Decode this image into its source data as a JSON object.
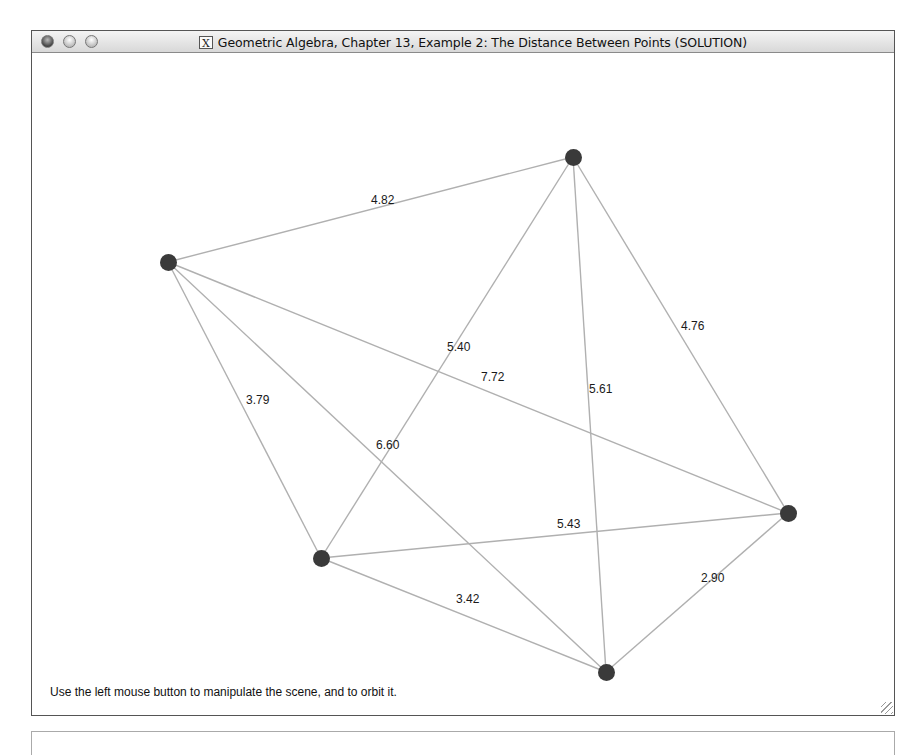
{
  "window": {
    "title": "Geometric Algebra, Chapter 13, Example 2: The Distance Between Points (SOLUTION)",
    "app_icon": "x11-icon",
    "controls": [
      "close",
      "minimize",
      "zoom"
    ]
  },
  "scene": {
    "hint": "Use the left mouse button to manipulate the scene, and to orbit it.",
    "node_color": "#3a3a3a",
    "edge_color": "#b0b0b0",
    "nodes": [
      {
        "id": "A",
        "x": 167,
        "y": 261
      },
      {
        "id": "B",
        "x": 572,
        "y": 156
      },
      {
        "id": "C",
        "x": 787,
        "y": 512
      },
      {
        "id": "D",
        "x": 320,
        "y": 557
      },
      {
        "id": "E",
        "x": 605,
        "y": 671
      }
    ],
    "edges": [
      {
        "from": "A",
        "to": "B",
        "label": "4.82",
        "lx": 370,
        "ly": 199
      },
      {
        "from": "B",
        "to": "C",
        "label": "4.76",
        "lx": 680,
        "ly": 325
      },
      {
        "from": "B",
        "to": "D",
        "label": "5.40",
        "lx": 446,
        "ly": 346
      },
      {
        "from": "B",
        "to": "E",
        "label": "5.61",
        "lx": 588,
        "ly": 388
      },
      {
        "from": "A",
        "to": "C",
        "label": "7.72",
        "lx": 480,
        "ly": 376
      },
      {
        "from": "A",
        "to": "D",
        "label": "3.79",
        "lx": 245,
        "ly": 399
      },
      {
        "from": "A",
        "to": "E",
        "label": "6.60",
        "lx": 375,
        "ly": 444
      },
      {
        "from": "D",
        "to": "C",
        "label": "5.43",
        "lx": 556,
        "ly": 523
      },
      {
        "from": "D",
        "to": "E",
        "label": "3.42",
        "lx": 455,
        "ly": 598
      },
      {
        "from": "C",
        "to": "E",
        "label": "2.90",
        "lx": 700,
        "ly": 577
      }
    ]
  }
}
